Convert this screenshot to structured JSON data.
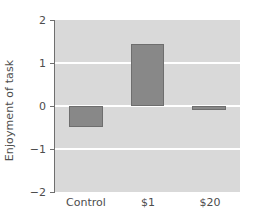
{
  "chart_data": {
    "type": "bar",
    "title": "",
    "xlabel": "",
    "ylabel": "Enjoyment of task",
    "categories": [
      "Control",
      "$1",
      "$20"
    ],
    "values": [
      -0.49,
      1.45,
      -0.09
    ],
    "ylim": [
      -2,
      2
    ],
    "yticks": [
      2,
      1,
      0,
      -1,
      -2
    ],
    "ytick_labels": [
      "2",
      "1",
      "0",
      "−1",
      "−2"
    ],
    "grid": true,
    "legend": "none",
    "bar_color": "#888888",
    "bar_edge_color": "#6e6e6e",
    "plot_background": "#d9d9d9",
    "gridline_color": "#ffffff",
    "figure_background": "#ffffff",
    "text_color": "#4d4d4d"
  }
}
